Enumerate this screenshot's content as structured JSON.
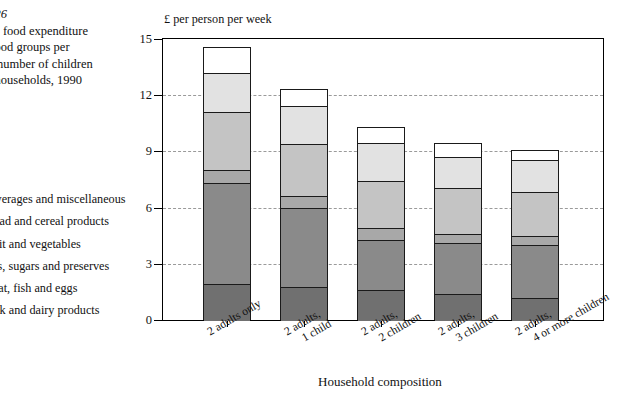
{
  "caption": {
    "figure_number": "re 2.26",
    "lines": [
      "ehold food expenditure",
      "ain food groups per",
      "n by number of children",
      "dult households, 1990"
    ]
  },
  "legend": {
    "items": [
      {
        "label": "Beverages and miscellaneous",
        "color": "#ffffff"
      },
      {
        "label": "Bread and cereal products",
        "color": "#e2e2e2"
      },
      {
        "label": "Fruit and vegetables",
        "color": "#c4c4c4"
      },
      {
        "label": "Fats, sugars and preserves",
        "color": "#a8a8a8"
      },
      {
        "label": "Meat, fish and eggs",
        "color": "#8a8a8a"
      },
      {
        "label": "Milk and dairy products",
        "color": "#707070"
      }
    ]
  },
  "axis": {
    "y_title": "£ per person per week",
    "x_title": "Household composition",
    "y_ticks": [
      "0",
      "3",
      "6",
      "9",
      "12",
      "15"
    ]
  },
  "chart_data": {
    "type": "bar",
    "subtype": "stacked",
    "xlabel": "Household composition",
    "ylabel": "£ per person per week",
    "ylim": [
      0,
      15
    ],
    "ytick_interval": 3,
    "grid": "horizontal-dashed",
    "legend_position": "left",
    "categories": [
      "2 adults only",
      "2 adults, 1 child",
      "2 adults, 2 children",
      "2 adults, 3 children",
      "2 adults, 4 or more children"
    ],
    "series": [
      {
        "name": "Milk and dairy products",
        "color": "#707070",
        "values": [
          1.9,
          1.75,
          1.6,
          1.4,
          1.2
        ]
      },
      {
        "name": "Meat, fish and eggs",
        "color": "#8a8a8a",
        "values": [
          5.4,
          4.25,
          2.65,
          2.7,
          2.8
        ]
      },
      {
        "name": "Fats, sugars and preserves",
        "color": "#a8a8a8",
        "values": [
          0.7,
          0.6,
          0.65,
          0.5,
          0.5
        ]
      },
      {
        "name": "Fruit and vegetables",
        "color": "#c4c4c4",
        "values": [
          3.1,
          2.8,
          2.5,
          2.45,
          2.35
        ]
      },
      {
        "name": "Bread and cereal products",
        "color": "#e2e2e2",
        "values": [
          2.1,
          2.0,
          2.05,
          1.65,
          1.7
        ]
      },
      {
        "name": "Beverages and miscellaneous",
        "color": "#ffffff",
        "values": [
          1.4,
          0.95,
          0.85,
          0.75,
          0.55
        ]
      }
    ],
    "totals": [
      14.6,
      12.35,
      10.3,
      9.45,
      9.1
    ]
  }
}
